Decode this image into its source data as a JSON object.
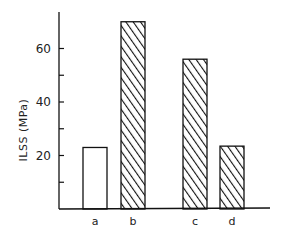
{
  "chart_data": {
    "type": "bar",
    "title": "",
    "xlabel": "",
    "ylabel": "ILSS (MPa)",
    "categories": [
      "a",
      "b",
      "c",
      "d"
    ],
    "values": [
      23,
      70,
      56,
      23.5
    ],
    "fill_patterns": [
      "none",
      "hatched",
      "hatched",
      "hatched"
    ],
    "ylim": [
      0,
      72
    ],
    "yticks": [
      10,
      20,
      30,
      40,
      50,
      60
    ],
    "ytick_labels": [
      "20",
      "40",
      "60"
    ],
    "grid": false,
    "legend": null
  }
}
